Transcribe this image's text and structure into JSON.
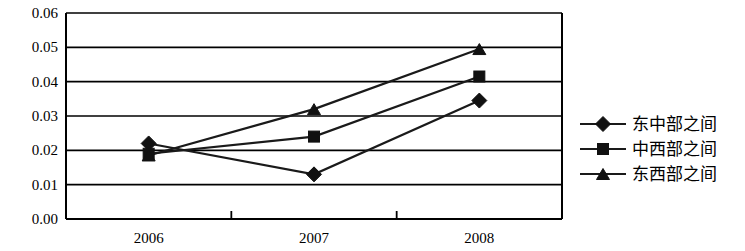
{
  "chart_data": {
    "type": "line",
    "title": "",
    "subtitle": "",
    "xlabel": "",
    "ylabel": "",
    "categories": [
      "2006",
      "2007",
      "2008"
    ],
    "series": [
      {
        "name": "东中部之间",
        "marker": "diamond",
        "values": [
          0.022,
          0.013,
          0.0345
        ]
      },
      {
        "name": "中西部之间",
        "marker": "square",
        "values": [
          0.019,
          0.024,
          0.0415
        ]
      },
      {
        "name": "东西部之间",
        "marker": "triangle",
        "values": [
          0.0185,
          0.032,
          0.0495
        ]
      }
    ],
    "ylim": [
      0.0,
      0.06
    ],
    "ytick_labels": [
      "0.06",
      "0.05",
      "0.04",
      "0.03",
      "0.02",
      "0.01",
      "0.00"
    ],
    "ytick_values": [
      0.06,
      0.05,
      0.04,
      0.03,
      0.02,
      0.01,
      0.0
    ],
    "grid": "horizontal",
    "legend_position": "right",
    "line_color": "#1a1a1a",
    "marker_color": "#111111",
    "axis_color": "#000000",
    "background_color": "#ffffff"
  },
  "legend": {
    "items": [
      {
        "label": "东中部之间",
        "marker": "diamond"
      },
      {
        "label": "中西部之间",
        "marker": "square"
      },
      {
        "label": "东西部之间",
        "marker": "triangle"
      }
    ]
  },
  "axes": {
    "y_labels": [
      "0.06",
      "0.05",
      "0.04",
      "0.03",
      "0.02",
      "0.01",
      "0.00"
    ],
    "x_labels": [
      "2006",
      "2007",
      "2008"
    ]
  }
}
